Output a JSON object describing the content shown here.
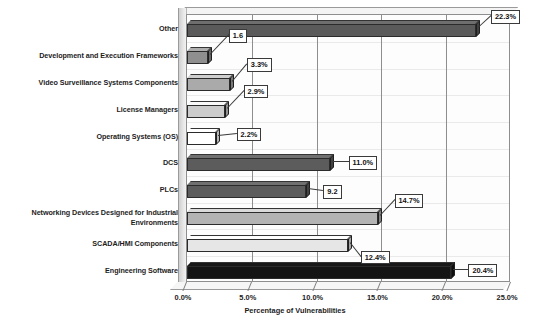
{
  "chart_data": {
    "type": "bar",
    "orientation": "horizontal",
    "title": "",
    "xlabel": "Percentage of Vulnerabilities",
    "ylabel": "",
    "xlim": [
      0,
      25
    ],
    "xticks": [
      "0.0%",
      "5.0%",
      "10.0%",
      "15.0%",
      "20.0%",
      "25.0%"
    ],
    "xtick_values": [
      0,
      5,
      10,
      15,
      20,
      25
    ],
    "grid": "vertical",
    "legend": "none",
    "categories": [
      "Other",
      "Development and Execution Frameworks",
      "Video Surveillance Systems Components",
      "License Managers",
      "Operating Systems (OS)",
      "DCS",
      "PLCs",
      "Networking Devices Designed for Industrial Environments",
      "SCADA/HMI Components",
      "Engineering Software"
    ],
    "values": [
      22.3,
      1.6,
      3.3,
      2.9,
      2.2,
      11.0,
      9.2,
      14.7,
      12.4,
      20.4
    ],
    "data_labels": [
      "22.3%",
      "1.6",
      "3.3%",
      "2.9%",
      "2.2%",
      "11.0%",
      "9.2",
      "14.7%",
      "12.4%",
      "20.4%"
    ],
    "bar_colors": [
      "#5a5a5a",
      "#8f8f8f",
      "#aaaaaa",
      "#cccccc",
      "#ffffff",
      "#5c5c5c",
      "#5c5c5c",
      "#b3b3b3",
      "#e6e6e6",
      "#141414"
    ]
  },
  "axis": {
    "value_axis_title": "Percentage of Vulnerabilities"
  }
}
